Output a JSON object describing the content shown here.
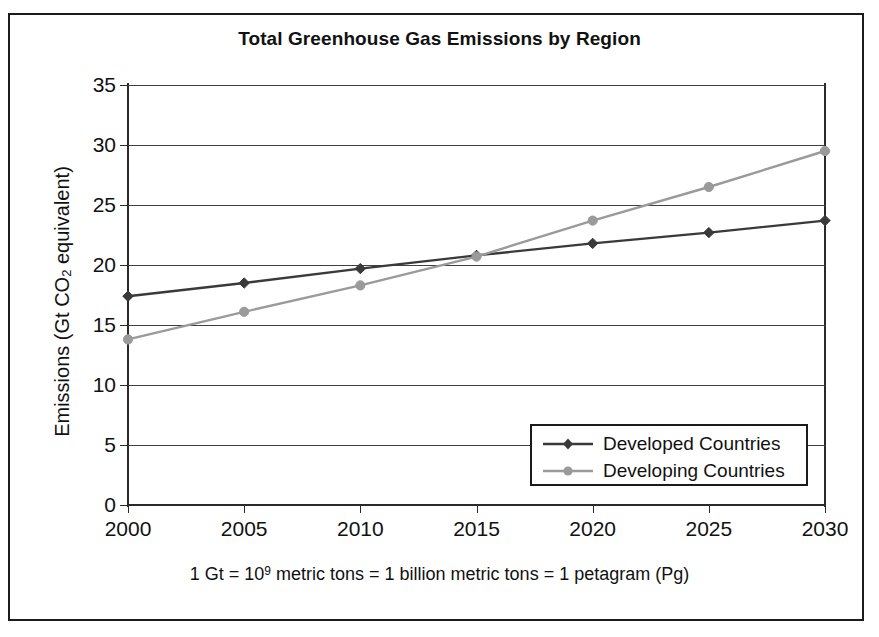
{
  "chart_data": {
    "type": "line",
    "title": "Total Greenhouse Gas Emissions by Region",
    "xlabel": "",
    "ylabel": "Emissions (Gt CO2 equivalent)",
    "ylabel_parts": {
      "prefix": "Emissions (Gt CO",
      "sub": "2",
      "suffix": " equivalent)"
    },
    "x": [
      2000,
      2005,
      2010,
      2015,
      2020,
      2025,
      2030
    ],
    "categories": [
      "2000",
      "2005",
      "2010",
      "2015",
      "2020",
      "2025",
      "2030"
    ],
    "xlim": [
      2000,
      2030
    ],
    "ylim": [
      0,
      35
    ],
    "yticks": [
      0,
      5,
      10,
      15,
      20,
      25,
      30,
      35
    ],
    "ytick_labels": [
      "0",
      "5",
      "10",
      "15",
      "20",
      "25",
      "30",
      "35"
    ],
    "grid": true,
    "grid_axis": "y",
    "legend_position": "lower right",
    "series": [
      {
        "name": "Developed Countries",
        "values": [
          17.4,
          18.5,
          19.7,
          20.8,
          21.8,
          22.7,
          23.7
        ],
        "color": "#3a3a3a",
        "marker": "diamond"
      },
      {
        "name": "Developing Countries",
        "values": [
          13.8,
          16.1,
          18.3,
          20.7,
          23.7,
          26.5,
          29.5
        ],
        "color": "#9a9a9a",
        "marker": "circle"
      }
    ]
  },
  "legend": {
    "items": [
      {
        "label": "Developed Countries",
        "color": "#3a3a3a",
        "marker": "diamond"
      },
      {
        "label": "Developing Countries",
        "color": "#9a9a9a",
        "marker": "circle"
      }
    ]
  },
  "footnote": {
    "part1": "1 Gt = 10",
    "exponent": "9",
    "part2": " metric tons = 1 billion metric tons = 1 petagram (Pg)"
  },
  "colors": {
    "frame": "#1b1b1b",
    "axis": "#2a2a2a",
    "grid": "#3f3f3f",
    "developed": "#3a3a3a",
    "developing": "#9a9a9a",
    "background": "#ffffff"
  }
}
